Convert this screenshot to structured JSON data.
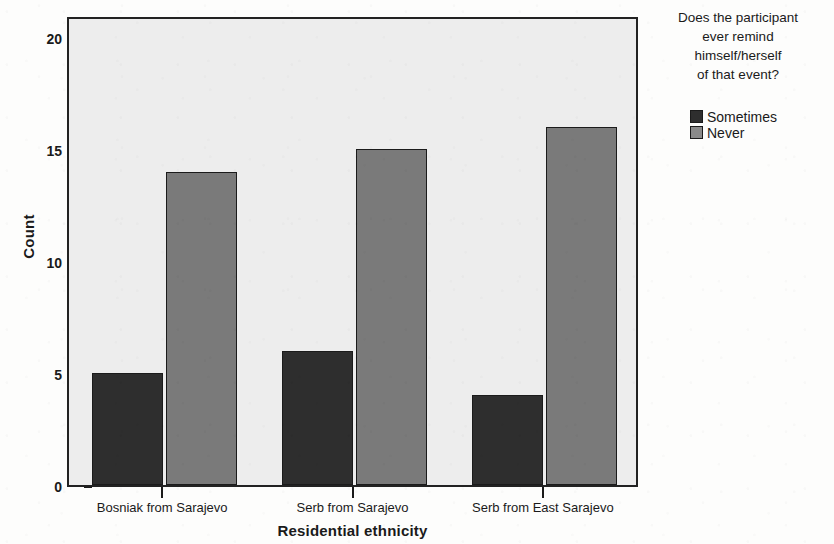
{
  "chart_data": {
    "type": "bar",
    "title": "",
    "subtitle": "",
    "xlabel": "Residential ethnicity",
    "ylabel": "Count",
    "categories": [
      "Bosniak from Sarajevo",
      "Serb from Sarajevo",
      "Serb from East Sarajevo"
    ],
    "series": [
      {
        "name": "Sometimes",
        "values": [
          5,
          6,
          4
        ],
        "color": "#2e2e2e"
      },
      {
        "name": "Never",
        "values": [
          14,
          15,
          16
        ],
        "color": "#7a7a7a"
      }
    ],
    "ylim": [
      0,
      21
    ],
    "yticks": [
      0,
      5,
      10,
      15,
      20
    ],
    "ytick_labels": [
      "0",
      "5",
      "10",
      "15",
      "20"
    ],
    "grid": false,
    "legend_position": "right",
    "legend_title": "Does the participant\never remind\nhimself/herself\nof that event?",
    "plot_background": "#ededed",
    "page_background": "#fdfdfc",
    "axis_color": "#222222"
  },
  "legend": {
    "title": "Does the participant\never remind\nhimself/herself\nof that event?",
    "entries": [
      {
        "label": "Sometimes",
        "color": "#2e2e2e"
      },
      {
        "label": "Never",
        "color": "#8a8a8a"
      }
    ]
  },
  "axes": {
    "y_title": "Count",
    "x_title": "Residential ethnicity"
  }
}
